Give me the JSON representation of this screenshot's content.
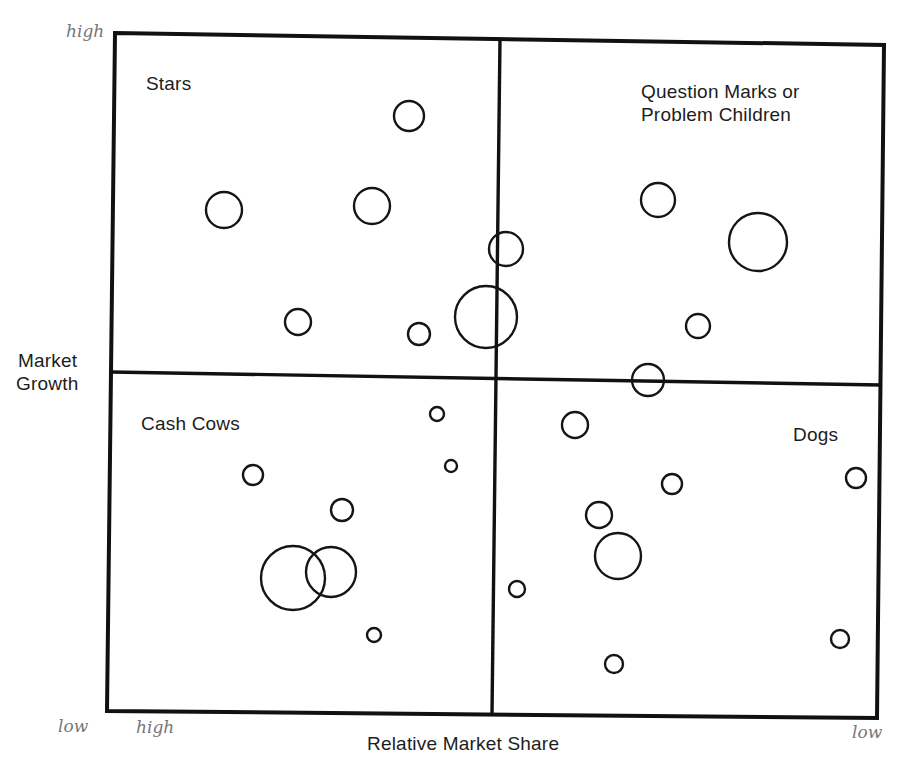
{
  "diagram": {
    "y_axis_label_line1": "Market",
    "y_axis_label_line2": "Growth",
    "x_axis_label": "Relative Market Share",
    "quadrants": {
      "top_left": "Stars",
      "top_right_line1": "Question Marks or",
      "top_right_line2": "Problem Children",
      "bottom_left": "Cash Cows",
      "bottom_right": "Dogs"
    },
    "handwritten": {
      "y_high": "high",
      "y_low": "low",
      "x_high": "high",
      "x_low": "low"
    },
    "colors": {
      "line": "#111111",
      "text": "#1d1d1d",
      "handwriting": "#777777",
      "background": "#ffffff"
    },
    "bubbles": {
      "stars": [
        {
          "cx": 409,
          "cy": 116,
          "r": 15
        },
        {
          "cx": 224,
          "cy": 210,
          "r": 18
        },
        {
          "cx": 372,
          "cy": 206,
          "r": 18
        },
        {
          "cx": 298,
          "cy": 322,
          "r": 13
        },
        {
          "cx": 419,
          "cy": 334,
          "r": 11
        },
        {
          "cx": 486,
          "cy": 317,
          "r": 31
        },
        {
          "cx": 506,
          "cy": 249,
          "r": 17
        }
      ],
      "question_marks": [
        {
          "cx": 658,
          "cy": 200,
          "r": 17
        },
        {
          "cx": 758,
          "cy": 242,
          "r": 29
        },
        {
          "cx": 698,
          "cy": 326,
          "r": 12
        },
        {
          "cx": 648,
          "cy": 380,
          "r": 16
        }
      ],
      "cash_cows": [
        {
          "cx": 437,
          "cy": 414,
          "r": 7
        },
        {
          "cx": 451,
          "cy": 466,
          "r": 6
        },
        {
          "cx": 253,
          "cy": 475,
          "r": 10
        },
        {
          "cx": 342,
          "cy": 510,
          "r": 11
        },
        {
          "cx": 293,
          "cy": 578,
          "r": 32
        },
        {
          "cx": 331,
          "cy": 572,
          "r": 25
        },
        {
          "cx": 374,
          "cy": 635,
          "r": 7
        }
      ],
      "dogs": [
        {
          "cx": 575,
          "cy": 425,
          "r": 13
        },
        {
          "cx": 672,
          "cy": 484,
          "r": 10
        },
        {
          "cx": 856,
          "cy": 478,
          "r": 10
        },
        {
          "cx": 599,
          "cy": 515,
          "r": 13
        },
        {
          "cx": 618,
          "cy": 556,
          "r": 23
        },
        {
          "cx": 517,
          "cy": 589,
          "r": 8
        },
        {
          "cx": 840,
          "cy": 639,
          "r": 9
        },
        {
          "cx": 614,
          "cy": 664,
          "r": 9
        }
      ]
    }
  }
}
